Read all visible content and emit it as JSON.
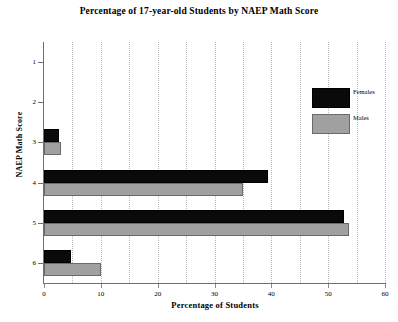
{
  "chart_data": {
    "type": "bar",
    "orientation": "horizontal",
    "title": "Percentage of 17-year-old Students by NAEP Math Score",
    "xlabel": "Percentage of Students",
    "ylabel": "NAEP Math Score",
    "categories": [
      "1",
      "2",
      "3",
      "4",
      "5",
      "6"
    ],
    "series": [
      {
        "name": "Females",
        "color": "#0a0a0a",
        "values": [
          0,
          0,
          2.6,
          39.5,
          52.7,
          4.7
        ]
      },
      {
        "name": "Males",
        "color": "#a0a0a0",
        "values": [
          0,
          0,
          3.0,
          35.0,
          53.6,
          10.0
        ]
      }
    ],
    "xlim": [
      0,
      60
    ],
    "xticks": [
      "0",
      "10",
      "20",
      "30",
      "40",
      "50",
      "60"
    ],
    "xtick_values": [
      0,
      10,
      20,
      30,
      40,
      50,
      60
    ],
    "yticks": [
      "1",
      "2",
      "3",
      "4",
      "5",
      "6"
    ],
    "gridlines": {
      "vertical_dotted_every": 5,
      "horizontal": false
    },
    "legend": {
      "position": "upper-right-inside",
      "entries": [
        {
          "label": "Females",
          "color": "#0a0a0a"
        },
        {
          "label": "Males",
          "color": "#a0a0a0"
        }
      ]
    }
  }
}
